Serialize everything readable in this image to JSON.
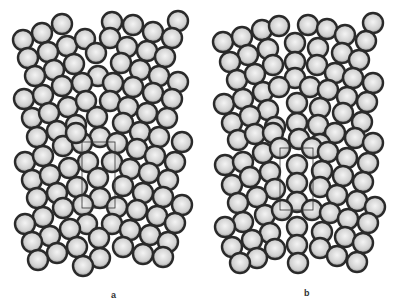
{
  "figure": {
    "panels": [
      {
        "label": "a",
        "box": {
          "x": 82,
          "y": 142,
          "w": 33,
          "h": 66
        },
        "circles": [
          [
            62,
            24
          ],
          [
            112,
            22
          ],
          [
            133,
            25
          ],
          [
            153,
            32
          ],
          [
            178,
            21
          ],
          [
            23,
            40
          ],
          [
            42,
            33
          ],
          [
            67,
            46
          ],
          [
            85,
            39
          ],
          [
            110,
            38
          ],
          [
            127,
            47
          ],
          [
            147,
            51
          ],
          [
            172,
            38
          ],
          [
            28,
            58
          ],
          [
            48,
            52
          ],
          [
            96,
            53
          ],
          [
            121,
            63
          ],
          [
            140,
            70
          ],
          [
            165,
            57
          ],
          [
            74,
            64
          ],
          [
            54,
            70
          ],
          [
            35,
            76
          ],
          [
            98,
            76
          ],
          [
            113,
            83
          ],
          [
            82,
            83
          ],
          [
            62,
            86
          ],
          [
            133,
            87
          ],
          [
            159,
            76
          ],
          [
            178,
            82
          ],
          [
            153,
            93
          ],
          [
            172,
            99
          ],
          [
            24,
            99
          ],
          [
            43,
            95
          ],
          [
            68,
            107
          ],
          [
            86,
            101
          ],
          [
            110,
            101
          ],
          [
            128,
            107
          ],
          [
            147,
            113
          ],
          [
            32,
            118
          ],
          [
            49,
            113
          ],
          [
            76,
            125
          ],
          [
            97,
            117
          ],
          [
            123,
            123
          ],
          [
            167,
            118
          ],
          [
            37,
            137
          ],
          [
            57,
            131
          ],
          [
            140,
            132
          ],
          [
            159,
            137
          ],
          [
            182,
            142
          ],
          [
            100,
            137
          ],
          [
            63,
            146
          ],
          [
            117,
            143
          ],
          [
            82,
            143
          ],
          [
            137,
            149
          ],
          [
            155,
            156
          ],
          [
            175,
            162
          ],
          [
            25,
            162
          ],
          [
            43,
            156
          ],
          [
            88,
            162
          ],
          [
            112,
            162
          ],
          [
            69,
            168
          ],
          [
            130,
            169
          ],
          [
            149,
            173
          ],
          [
            32,
            180
          ],
          [
            50,
            175
          ],
          [
            98,
            178
          ],
          [
            123,
            186
          ],
          [
            168,
            180
          ],
          [
            77,
            187
          ],
          [
            57,
            193
          ],
          [
            143,
            193
          ],
          [
            37,
            198
          ],
          [
            100,
            198
          ],
          [
            163,
            197
          ],
          [
            63,
            208
          ],
          [
            83,
            205
          ],
          [
            117,
            207
          ],
          [
            137,
            210
          ],
          [
            182,
            205
          ],
          [
            157,
            216
          ],
          [
            43,
            217
          ],
          [
            25,
            224
          ],
          [
            87,
            224
          ],
          [
            112,
            224
          ],
          [
            175,
            223
          ],
          [
            70,
            229
          ],
          [
            130,
            230
          ],
          [
            150,
            235
          ],
          [
            50,
            236
          ],
          [
            32,
            242
          ],
          [
            99,
            238
          ],
          [
            168,
            242
          ],
          [
            77,
            247
          ],
          [
            123,
            247
          ],
          [
            57,
            253
          ],
          [
            143,
            254
          ],
          [
            163,
            257
          ],
          [
            38,
            260
          ],
          [
            100,
            258
          ],
          [
            83,
            266
          ],
          [
            76,
            133
          ]
        ]
      },
      {
        "label": "b",
        "box": {
          "x": 280,
          "y": 148,
          "w": 33,
          "h": 62
        },
        "circles": [
          [
            373,
            23
          ],
          [
            262,
            30
          ],
          [
            279,
            26
          ],
          [
            308,
            25
          ],
          [
            327,
            29
          ],
          [
            345,
            35
          ],
          [
            366,
            41
          ],
          [
            223,
            42
          ],
          [
            242,
            37
          ],
          [
            268,
            49
          ],
          [
            295,
            43
          ],
          [
            318,
            48
          ],
          [
            342,
            53
          ],
          [
            248,
            55
          ],
          [
            230,
            62
          ],
          [
            273,
            65
          ],
          [
            295,
            62
          ],
          [
            317,
            65
          ],
          [
            335,
            73
          ],
          [
            359,
            60
          ],
          [
            237,
            80
          ],
          [
            255,
            74
          ],
          [
            295,
            78
          ],
          [
            310,
            87
          ],
          [
            328,
            90
          ],
          [
            353,
            78
          ],
          [
            373,
            83
          ],
          [
            263,
            92
          ],
          [
            279,
            87
          ],
          [
            347,
            97
          ],
          [
            367,
            102
          ],
          [
            224,
            104
          ],
          [
            243,
            99
          ],
          [
            268,
            110
          ],
          [
            297,
            103
          ],
          [
            320,
            108
          ],
          [
            343,
            113
          ],
          [
            232,
            123
          ],
          [
            250,
            116
          ],
          [
            275,
            127
          ],
          [
            297,
            123
          ],
          [
            318,
            125
          ],
          [
            362,
            122
          ],
          [
            238,
            140
          ],
          [
            255,
            134
          ],
          [
            335,
            133
          ],
          [
            355,
            138
          ],
          [
            373,
            143
          ],
          [
            299,
            139
          ],
          [
            320,
            144
          ],
          [
            273,
            133
          ],
          [
            263,
            153
          ],
          [
            280,
            148
          ],
          [
            312,
            148
          ],
          [
            328,
            152
          ],
          [
            347,
            158
          ],
          [
            368,
            163
          ],
          [
            225,
            165
          ],
          [
            243,
            162
          ],
          [
            297,
            165
          ],
          [
            270,
            172
          ],
          [
            322,
            171
          ],
          [
            343,
            176
          ],
          [
            232,
            185
          ],
          [
            250,
            177
          ],
          [
            297,
            183
          ],
          [
            320,
            187
          ],
          [
            363,
            182
          ],
          [
            275,
            189
          ],
          [
            257,
            197
          ],
          [
            337,
            195
          ],
          [
            238,
            203
          ],
          [
            297,
            202
          ],
          [
            357,
            201
          ],
          [
            265,
            215
          ],
          [
            282,
            210
          ],
          [
            312,
            210
          ],
          [
            330,
            213
          ],
          [
            375,
            207
          ],
          [
            348,
            219
          ],
          [
            243,
            222
          ],
          [
            225,
            227
          ],
          [
            297,
            227
          ],
          [
            322,
            232
          ],
          [
            368,
            223
          ],
          [
            270,
            233
          ],
          [
            252,
            240
          ],
          [
            345,
            237
          ],
          [
            232,
            247
          ],
          [
            297,
            245
          ],
          [
            275,
            249
          ],
          [
            320,
            248
          ],
          [
            363,
            243
          ],
          [
            257,
            258
          ],
          [
            337,
            256
          ],
          [
            240,
            263
          ],
          [
            298,
            263
          ],
          [
            357,
            262
          ]
        ]
      }
    ],
    "circle_radius": 10,
    "ring_color": "#2a2a2a",
    "fill_color": "#d8d8d8"
  }
}
